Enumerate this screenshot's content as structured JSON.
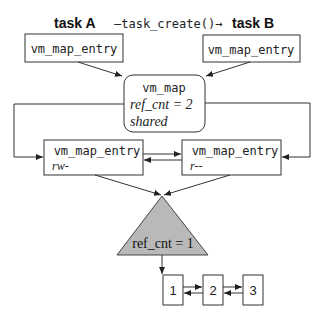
{
  "header": {
    "task_a": "task A",
    "arrow_label": "—task_create()→",
    "task_b": "task B"
  },
  "boxes": {
    "entry_a": "vm_map_entry",
    "entry_b": "vm_map_entry",
    "vm_map": {
      "title": "vm_map",
      "ref_cnt": "ref_cnt = 2",
      "status": "shared"
    },
    "entry_rw": {
      "title": "vm_map_entry",
      "perm": "rw-"
    },
    "entry_r": {
      "title": "vm_map_entry",
      "perm": "r--"
    }
  },
  "object": {
    "ref_cnt": "ref_cnt = 1",
    "fill": "#b9b9b9"
  },
  "pages": [
    "1",
    "2",
    "3"
  ]
}
